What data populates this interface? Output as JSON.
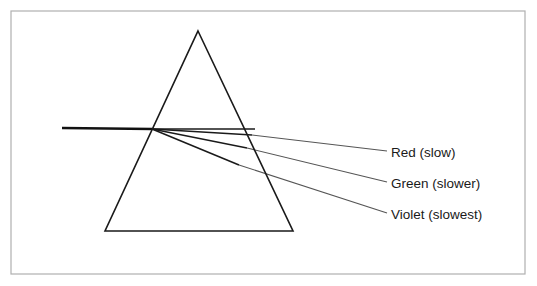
{
  "figure": {
    "background_color": "#ffffff",
    "frame": {
      "name": "outer-border",
      "color": "#b0b0b0",
      "x": 11,
      "y": 11,
      "width": 514,
      "height": 263,
      "stroke_width": 1.2
    },
    "prism": {
      "name": "triangular-prism",
      "stroke_color": "#1a1a1a",
      "stroke_width": 1.6,
      "fill": "none",
      "apex": {
        "x": 198,
        "y": 31
      },
      "base_left": {
        "x": 105,
        "y": 231
      },
      "base_right": {
        "x": 293,
        "y": 231
      }
    },
    "incident_ray": {
      "name": "incident-white-light-ray",
      "label": "incident white light",
      "color": "#111111",
      "stroke_width": 2.6,
      "start": {
        "x": 62,
        "y": 128
      },
      "end": {
        "x": 152,
        "y": 129
      }
    },
    "entry_point": {
      "x": 152,
      "y": 129
    },
    "rays": [
      {
        "id": "red",
        "label": "Red (slow)",
        "color": "#1a1a1a",
        "stroke_width": 1.5,
        "internal_end": {
          "x": 252,
          "y": 135
        },
        "leader_end": {
          "x": 387,
          "y": 151
        },
        "label_anchor": {
          "x": 391,
          "y": 157
        }
      },
      {
        "id": "green",
        "label": "Green (slower)",
        "color": "#1a1a1a",
        "stroke_width": 1.5,
        "internal_end": {
          "x": 247,
          "y": 148
        },
        "leader_end": {
          "x": 387,
          "y": 182
        },
        "label_anchor": {
          "x": 391,
          "y": 188
        }
      },
      {
        "id": "violet",
        "label": "Violet (slowest)",
        "color": "#1a1a1a",
        "stroke_width": 1.5,
        "internal_end": {
          "x": 239,
          "y": 165
        },
        "leader_end": {
          "x": 387,
          "y": 213
        },
        "label_anchor": {
          "x": 391,
          "y": 219
        }
      }
    ],
    "refracted_rays_straight_segment": {
      "name": "prism-internal-horizontal-ray",
      "note": "horizontal ray continuing from entry point to right face",
      "start": {
        "x": 152,
        "y": 129
      },
      "end": {
        "x": 255,
        "y": 129
      }
    },
    "labels": {
      "red": "Red (slow)",
      "green": "Green (slower)",
      "violet": "Violet (slowest)"
    }
  }
}
